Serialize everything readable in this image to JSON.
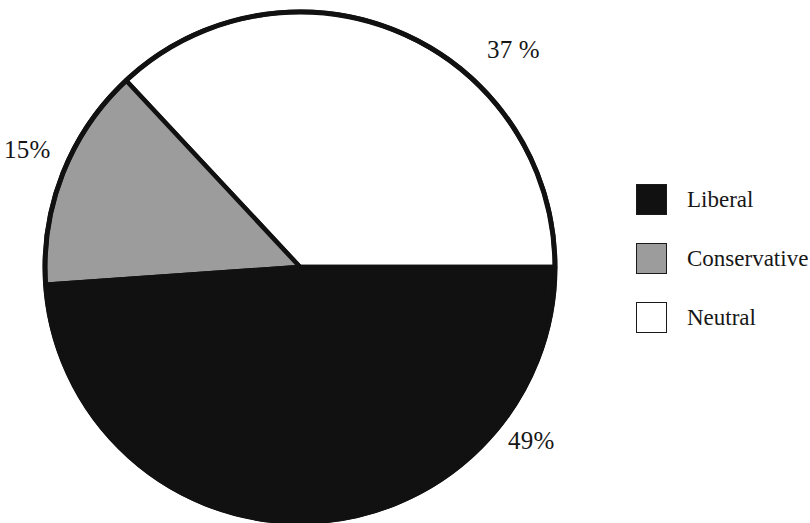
{
  "chart_data": {
    "type": "pie",
    "title": "",
    "subtitle": "",
    "xlabel": "",
    "ylabel": "",
    "categories": [
      "Liberal",
      "Conservative",
      "Neutral"
    ],
    "values": [
      49,
      37,
      15
    ],
    "value_unit": "%",
    "slices": [
      {
        "label": "Liberal",
        "value": 49,
        "value_text": "49%",
        "color": "#111111",
        "start_angle_deg": 184,
        "end_angle_deg": 360
      },
      {
        "label": "Neutral",
        "value": 37,
        "value_text": "37 %",
        "color": "#ffffff",
        "start_angle_deg": 0,
        "end_angle_deg": 133
      },
      {
        "label": "Conservative",
        "value": 15,
        "value_text": "15%",
        "color": "#9c9c9c",
        "start_angle_deg": 133,
        "end_angle_deg": 184
      }
    ],
    "legend": {
      "position": "right",
      "entries": [
        {
          "label": "Liberal",
          "color": "#111111"
        },
        {
          "label": "Conservative",
          "color": "#9c9c9c"
        },
        {
          "label": "Neutral",
          "color": "#ffffff"
        }
      ]
    },
    "callouts": [
      {
        "id": "neutral",
        "text": "37 %"
      },
      {
        "id": "conservative",
        "text": "15%"
      },
      {
        "id": "liberal",
        "text": "49%"
      }
    ],
    "grid": false,
    "outline_color": "#111111",
    "background_color": "#ffffff"
  },
  "labels": {
    "pct_neutral": "37 %",
    "pct_conservative": "15%",
    "pct_liberal": "49%"
  },
  "legend": {
    "items": [
      {
        "label": "Liberal"
      },
      {
        "label": "Conservative"
      },
      {
        "label": "Neutral"
      }
    ]
  },
  "colors": {
    "liberal": "#111111",
    "conservative": "#9c9c9c",
    "neutral": "#ffffff",
    "outline": "#111111",
    "text": "#171717"
  }
}
